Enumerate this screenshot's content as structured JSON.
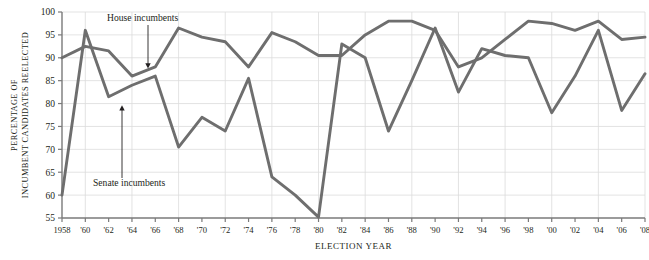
{
  "chart_data": {
    "type": "line",
    "title": "",
    "xlabel": "ELECTION YEAR",
    "ylabel": "PERCENTAGE OF INCUMBENT CANDIDATES REELECTED",
    "ylabel_line1": "PERCENTAGE OF",
    "ylabel_line2": "INCUMBENT CANDIDATES REELECTED",
    "x": [
      1958,
      1960,
      1962,
      1964,
      1966,
      1968,
      1970,
      1972,
      1974,
      1976,
      1978,
      1980,
      1982,
      1984,
      1986,
      1988,
      1990,
      1992,
      1994,
      1996,
      1998,
      2000,
      2002,
      2004,
      2006,
      2008
    ],
    "categories": [
      "1958",
      "'60",
      "'62",
      "'64",
      "'66",
      "'68",
      "'70",
      "'72",
      "'74",
      "'76",
      "'78",
      "'80",
      "'82",
      "'84",
      "'86",
      "'88",
      "'90",
      "'92",
      "'94",
      "'96",
      "'98",
      "'00",
      "'02",
      "'04",
      "'06",
      "'08"
    ],
    "xlim": [
      1958,
      2008
    ],
    "ylim": [
      55,
      100
    ],
    "yticks": [
      55,
      60,
      65,
      70,
      75,
      80,
      85,
      90,
      95,
      100
    ],
    "ytick_labels": [
      "55",
      "60",
      "65",
      "70",
      "75",
      "80",
      "85",
      "90",
      "95",
      "100"
    ],
    "grid": "both",
    "legend_position": "annotations-on-plot",
    "series": [
      {
        "name": "House incumbents",
        "color": "#6e6e6e",
        "values": [
          90.0,
          92.5,
          91.5,
          86.0,
          88.0,
          96.5,
          94.5,
          93.5,
          88.0,
          95.5,
          93.5,
          90.5,
          90.5,
          95.0,
          98.0,
          98.0,
          96.0,
          88.0,
          90.0,
          94.0,
          98.0,
          97.5,
          96.0,
          98.0,
          94.0,
          94.5
        ]
      },
      {
        "name": "Senate incumbents",
        "color": "#6e6e6e",
        "values": [
          60.0,
          96.0,
          81.5,
          84.0,
          86.0,
          70.5,
          77.0,
          74.0,
          85.5,
          64.0,
          60.0,
          55.2,
          93.0,
          90.0,
          74.0,
          85.0,
          96.5,
          82.5,
          92.0,
          90.5,
          90.0,
          78.0,
          86.0,
          96.0,
          78.5,
          86.5
        ]
      }
    ],
    "annotations": [
      {
        "label": "House incumbents",
        "points_to_year": 1964,
        "points_to_value": 86.0
      },
      {
        "label": "Senate incumbents",
        "points_to_year": 1962,
        "points_to_value": 81.5
      }
    ]
  },
  "colors": {
    "line": "#6e6e6e",
    "axis": "#7a7a7a",
    "grid": "#dcdcdc",
    "text": "#231f20",
    "caption": "#8a8a8a"
  }
}
